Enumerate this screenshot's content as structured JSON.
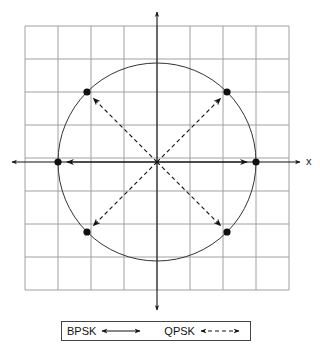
{
  "diagram": {
    "title": "",
    "grid": {
      "cols": 8,
      "rows": 8,
      "left": 25,
      "top": 26,
      "cell": 33,
      "color": "#9a9a9a"
    },
    "origin": {
      "x": 157,
      "y": 162
    },
    "circle_radius": 99,
    "axis_label_x": "x",
    "constellation_points": [
      {
        "name": "bpsk-0",
        "angle_deg": 0
      },
      {
        "name": "bpsk-180",
        "angle_deg": 180
      },
      {
        "name": "qpsk-45",
        "angle_deg": 45
      },
      {
        "name": "qpsk-135",
        "angle_deg": 135
      },
      {
        "name": "qpsk-225",
        "angle_deg": 225
      },
      {
        "name": "qpsk-315",
        "angle_deg": 315
      }
    ]
  },
  "legend": {
    "items": [
      {
        "label": "BPSK",
        "style": "solid double-headed arrow"
      },
      {
        "label": "QPSK",
        "style": "dashed double-headed arrow"
      }
    ]
  }
}
